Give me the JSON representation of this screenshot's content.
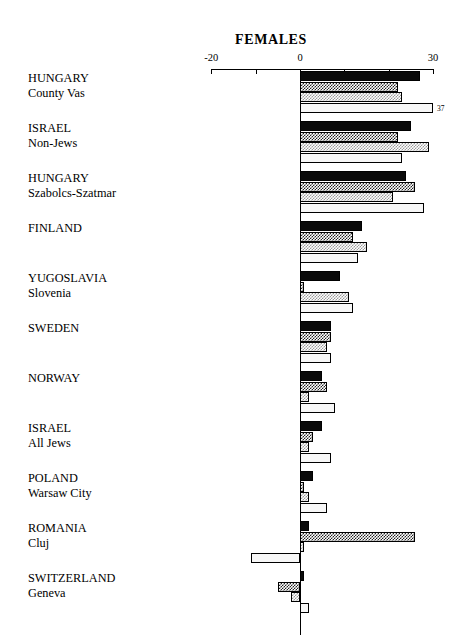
{
  "chart_data": {
    "type": "bar",
    "orientation": "horizontal",
    "title": "FEMALES",
    "xlabel": "",
    "ylabel": "",
    "xlim": [
      -20,
      30
    ],
    "xticks": [
      -20,
      -10,
      0,
      10,
      20,
      30
    ],
    "xtick_labels": [
      "-20",
      "",
      "0",
      "",
      "",
      "30"
    ],
    "grid": false,
    "legend": "none",
    "categories": [
      "HUNGARY County Vas",
      "ISRAEL Non-Jews",
      "HUNGARY Szabolcs-Szatmar",
      "FINLAND",
      "YUGOSLAVIA Slovenia",
      "SWEDEN",
      "NORWAY",
      "ISRAEL All Jews",
      "POLAND Warsaw City",
      "ROMANIA Cluj",
      "SWITZERLAND Geneva"
    ],
    "series": [
      {
        "name": "series-1",
        "fill": "solid-black",
        "values": [
          27,
          25,
          24,
          14,
          9,
          7,
          5,
          5,
          3,
          2,
          1
        ]
      },
      {
        "name": "series-2",
        "fill": "dark-checker",
        "values": [
          22,
          22,
          26,
          12,
          1,
          7,
          6,
          3,
          1,
          26,
          -5
        ]
      },
      {
        "name": "series-3",
        "fill": "light-checker",
        "values": [
          23,
          29,
          21,
          15,
          11,
          6,
          2,
          2,
          2,
          1,
          -2
        ]
      },
      {
        "name": "series-4",
        "fill": "white",
        "values": [
          30,
          23,
          28,
          13,
          12,
          7,
          8,
          7,
          6,
          -11,
          2
        ]
      }
    ],
    "annotations": [
      {
        "text": "37",
        "category": "HUNGARY County Vas",
        "series": "series-4"
      }
    ]
  },
  "axis": {
    "tick_labels": [
      {
        "value": -20,
        "text": "-20"
      },
      {
        "value": 0,
        "text": "0"
      },
      {
        "value": 30,
        "text": "30"
      }
    ]
  },
  "groups": [
    {
      "line1": "HUNGARY",
      "line2": "County Vas"
    },
    {
      "line1": "ISRAEL",
      "line2": "Non-Jews"
    },
    {
      "line1": "HUNGARY",
      "line2": "Szabolcs-Szatmar"
    },
    {
      "line1": "FINLAND",
      "line2": ""
    },
    {
      "line1": "YUGOSLAVIA",
      "line2": "Slovenia"
    },
    {
      "line1": "SWEDEN",
      "line2": ""
    },
    {
      "line1": "NORWAY",
      "line2": ""
    },
    {
      "line1": "ISRAEL",
      "line2": "All Jews"
    },
    {
      "line1": "POLAND",
      "line2": "Warsaw City"
    },
    {
      "line1": "ROMANIA",
      "line2": "Cluj"
    },
    {
      "line1": "SWITZERLAND",
      "line2": "Geneva"
    }
  ],
  "colors": {
    "ink": "#000000",
    "background": "#ffffff",
    "solid": "#0a0a0a",
    "dark_checker": "#242424",
    "light_checker": "#9a9a9a",
    "white_fill": "#f7f7f7"
  }
}
